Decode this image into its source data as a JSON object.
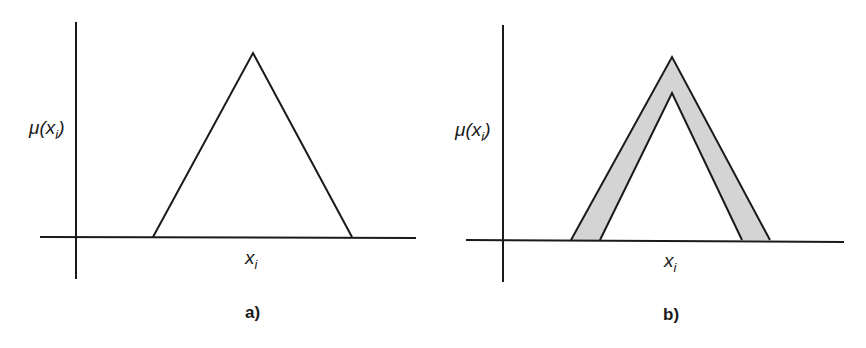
{
  "panels": [
    {
      "id": "a",
      "caption": "a)",
      "y_axis_label": {
        "main": "μ(x",
        "sub": "i",
        "close": ")"
      },
      "x_axis_label": {
        "main": "x",
        "sub": "i"
      },
      "shape": "triangular membership function (type-1)",
      "triangle": {
        "left": [
          153,
          237
        ],
        "apex": [
          253,
          53
        ],
        "right": [
          352,
          237
        ]
      }
    },
    {
      "id": "b",
      "caption": "b)",
      "y_axis_label": {
        "main": "μ(x",
        "sub": "i",
        "close": ")"
      },
      "x_axis_label": {
        "main": "x",
        "sub": "i"
      },
      "shape": "interval type-2 triangular membership function with shaded footprint of uncertainty",
      "outer_triangle": {
        "left": [
          571,
          240
        ],
        "apex": [
          672,
          57
        ],
        "right": [
          770,
          240
        ]
      },
      "inner_triangle": {
        "left": [
          600,
          240
        ],
        "apex": [
          672,
          93
        ],
        "right": [
          742,
          240
        ]
      },
      "fou_fill_color": "#d4d4d4"
    }
  ],
  "colors": {
    "line": "#1a1a1a",
    "background": "#ffffff",
    "fou": "#d4d4d4"
  }
}
